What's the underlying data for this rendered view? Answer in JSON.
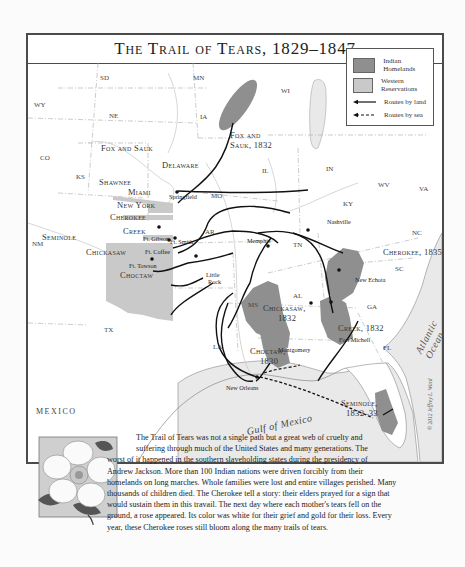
{
  "title": "The Trail of Tears, 1829–1847",
  "legend": {
    "items": [
      {
        "label": "Indian Homelands",
        "swatch": "#8f8f8f"
      },
      {
        "label": "Western Reservations",
        "swatch": "#c9c9c9"
      },
      {
        "label": "Routes by land",
        "style": "solid"
      },
      {
        "label": "Routes by sea",
        "style": "dashed"
      }
    ]
  },
  "states": [
    "SD",
    "MN",
    "WI",
    "WY",
    "NE",
    "IA",
    "CO",
    "KS",
    "IL",
    "IN",
    "MO",
    "KY",
    "WV",
    "VA",
    "NM",
    "AR",
    "TN",
    "NC",
    "SC",
    "AL",
    "GA",
    "MS",
    "TX",
    "LA",
    "FL"
  ],
  "nations": {
    "fox_sauk_west": "Fox and Sauk",
    "fox_sauk_home_1": "Fox and",
    "fox_sauk_home_2": "Sauk, 1832",
    "delaware": "Delaware",
    "shawnee": "Shawnee",
    "miami": "Miami",
    "new_york": "New York",
    "cherokee_west": "Cherokee",
    "seminole_west": "Seminole",
    "creek_west": "Creek",
    "chickasaw_west": "Chickasaw",
    "choctaw_west": "Choctaw",
    "cherokee_home": "Cherokee, 1835",
    "chickasaw_home_1": "Chickasaw,",
    "chickasaw_home_2": "1832",
    "creek_home": "Creek, 1832",
    "choctaw_home_1": "Choctaw,",
    "choctaw_home_2": "1830",
    "seminole_home_1": "Seminole,",
    "seminole_home_2": "1832–33"
  },
  "cities": {
    "springfield": "Springfield",
    "nashville": "Nashville",
    "memphis": "Memphis",
    "ft_gibson": "Ft. Gibson",
    "ft_smith": "Ft. Smith",
    "ft_coffee": "Ft. Coffee",
    "ft_towson": "Ft. Towson",
    "little_rock_1": "Little",
    "little_rock_2": "Rock",
    "new_echota": "New Echota",
    "fort_mitchell": "Fort Michell",
    "montgomery": "Montgomery",
    "new_orleans": "New Orleans"
  },
  "water": {
    "gulf": "Gulf of Mexico",
    "atlantic": "Atlantic Ocean"
  },
  "mexico": "MEXICO",
  "credit": "© 2012 Jeffrey L. Ward",
  "caption": {
    "lines": [
      "The Trail of Tears was not a single path but a great web of cruelty and",
      "suffering through much of the United States and many generations. The",
      "worst of it happened in the southern slaveholding states during the presidency of",
      "Andrew Jackson. More than 100 Indian nations were driven forcibly from their",
      "homelands on long marches. Whole families were lost and entire villages perished. Many",
      "thousands of children died. The Cherokee tell a story: their elders prayed for a sign that",
      "would sustain them in this travail. The next day where each mother's tears fell on the",
      "ground, a rose appeared. Its color was white for their grief and gold for their loss. Every",
      "year, these Cherokee roses still bloom along the many trails of tears."
    ]
  },
  "colors": {
    "homeland": "#8f8f8f",
    "reservation": "#c9c9c9",
    "water": "#e8e8e8",
    "border": "#4a4a4a"
  }
}
